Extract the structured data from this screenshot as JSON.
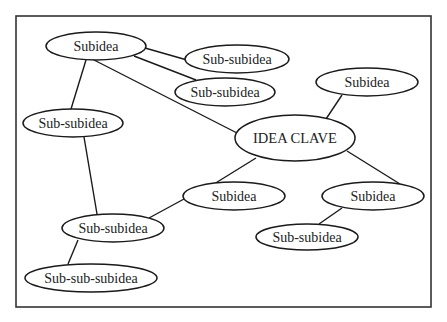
{
  "diagram": {
    "type": "mind-map",
    "colors": {
      "line": "#1a1a1a",
      "frame": "#333333",
      "background": "#ffffff",
      "text": "#222222"
    },
    "nodes": [
      {
        "id": "key",
        "label": "IDEA CLAVE",
        "cx": 295,
        "cy": 138,
        "rx": 60,
        "ry": 23
      },
      {
        "id": "sub1",
        "label": "Subidea",
        "cx": 96,
        "cy": 46,
        "rx": 50,
        "ry": 14
      },
      {
        "id": "sub2",
        "label": "Subidea",
        "cx": 367,
        "cy": 82,
        "rx": 51,
        "ry": 14
      },
      {
        "id": "sub3",
        "label": "Subidea",
        "cx": 234,
        "cy": 196,
        "rx": 51,
        "ry": 14
      },
      {
        "id": "sub4",
        "label": "Subidea",
        "cx": 373,
        "cy": 196,
        "rx": 51,
        "ry": 14
      },
      {
        "id": "ss1",
        "label": "Sub-subidea",
        "cx": 237,
        "cy": 59,
        "rx": 52,
        "ry": 14
      },
      {
        "id": "ss2",
        "label": "Sub-subidea",
        "cx": 225,
        "cy": 92,
        "rx": 50,
        "ry": 14
      },
      {
        "id": "ss3",
        "label": "Sub-subidea",
        "cx": 73,
        "cy": 123,
        "rx": 50,
        "ry": 14
      },
      {
        "id": "ss4",
        "label": "Sub-subidea",
        "cx": 113,
        "cy": 228,
        "rx": 51,
        "ry": 14
      },
      {
        "id": "ss5",
        "label": "Sub-subidea",
        "cx": 307,
        "cy": 237,
        "rx": 51,
        "ry": 13
      },
      {
        "id": "sss1",
        "label": "Sub-sub-subidea",
        "cx": 91,
        "cy": 278,
        "rx": 66,
        "ry": 14
      }
    ],
    "edges": [
      {
        "from": "sub1",
        "to": "ss1",
        "x1": 145,
        "y1": 48,
        "x2": 187,
        "y2": 60
      },
      {
        "from": "sub1",
        "to": "ss2",
        "x1": 134,
        "y1": 56,
        "x2": 196,
        "y2": 80
      },
      {
        "from": "sub1",
        "to": "key",
        "x1": 94,
        "y1": 60,
        "x2": 237,
        "y2": 133
      },
      {
        "from": "sub1",
        "to": "ss3",
        "x1": 86,
        "y1": 60,
        "x2": 71,
        "y2": 109
      },
      {
        "from": "ss3",
        "to": "ss4",
        "x1": 84,
        "y1": 137,
        "x2": 97,
        "y2": 214
      },
      {
        "from": "ss4",
        "to": "sub3",
        "x1": 149,
        "y1": 218,
        "x2": 184,
        "y2": 199
      },
      {
        "from": "ss4",
        "to": "sss1",
        "x1": 78,
        "y1": 240,
        "x2": 68,
        "y2": 264
      },
      {
        "from": "key",
        "to": "sub3",
        "x1": 256,
        "y1": 158,
        "x2": 214,
        "y2": 184
      },
      {
        "from": "key",
        "to": "sub2",
        "x1": 326,
        "y1": 119,
        "x2": 342,
        "y2": 95
      },
      {
        "from": "key",
        "to": "sub4",
        "x1": 347,
        "y1": 151,
        "x2": 400,
        "y2": 184
      },
      {
        "from": "sub4",
        "to": "ss5",
        "x1": 342,
        "y1": 208,
        "x2": 319,
        "y2": 224
      }
    ]
  }
}
